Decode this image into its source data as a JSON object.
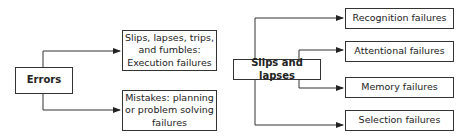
{
  "left_diagram": {
    "root": "Errors",
    "children": [
      "Slips, lapses, trips, and fumbles: Execution failures",
      "Mistakes: planning or problem solving failures"
    ]
  },
  "right_diagram": {
    "root": "Slips and lapses",
    "children": [
      "Recognition failures",
      "Attentional failures",
      "Memory failures",
      "Selection failures"
    ]
  }
}
